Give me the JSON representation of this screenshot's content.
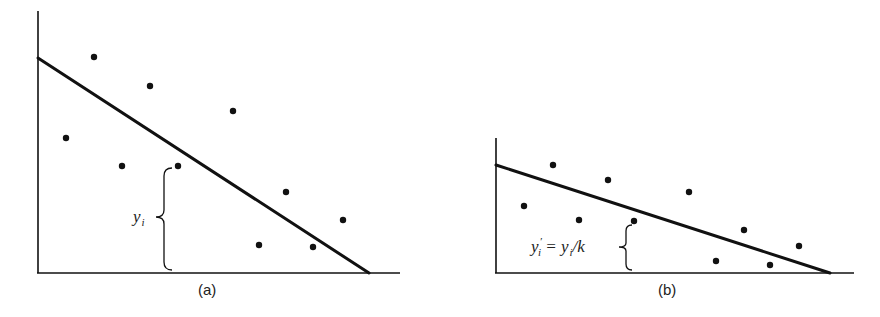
{
  "figure": {
    "panels": [
      {
        "id": "a",
        "caption": "(a)",
        "annotation": {
          "main": "y",
          "subscript": "i"
        },
        "axes": {
          "origin": [
            38,
            273
          ],
          "y_top": 11,
          "x_end": 400
        },
        "fit_line": {
          "from": [
            38,
            58
          ],
          "to": [
            369,
            273
          ]
        },
        "points": [
          [
            94,
            57
          ],
          [
            150,
            86
          ],
          [
            233,
            111
          ],
          [
            66,
            138
          ],
          [
            122,
            166
          ],
          [
            178,
            166
          ],
          [
            286,
            192
          ],
          [
            343,
            220
          ],
          [
            259,
            245
          ],
          [
            313,
            247
          ]
        ],
        "brace": {
          "x": 164,
          "top": 168,
          "bottom": 270,
          "tip_x": 155
        }
      },
      {
        "id": "b",
        "caption": "(b)",
        "annotation": {
          "lhs": "y",
          "lhs_super": "′",
          "lhs_subscript": "i",
          "equals": " = ",
          "rhs": "y",
          "rhs_subscript": "i",
          "rhs_tail": "/k"
        },
        "axes": {
          "origin": [
            496,
            273
          ],
          "y_top": 138,
          "x_end": 854
        },
        "fit_line": {
          "from": [
            496,
            165
          ],
          "to": [
            830,
            273
          ]
        },
        "points": [
          [
            553,
            165
          ],
          [
            608,
            180
          ],
          [
            689,
            192
          ],
          [
            524,
            206
          ],
          [
            579,
            220
          ],
          [
            634,
            221
          ],
          [
            744,
            230
          ],
          [
            799,
            246
          ],
          [
            716,
            261
          ],
          [
            770,
            265
          ]
        ],
        "brace": {
          "x": 626,
          "top": 225,
          "bottom": 270,
          "tip_x": 618
        }
      }
    ],
    "colors": {
      "ink": "#111111",
      "background": "#ffffff"
    }
  }
}
